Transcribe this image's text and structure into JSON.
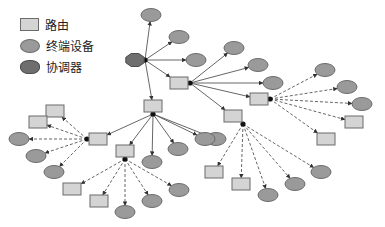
{
  "legend": {
    "items": [
      {
        "symbol": "router",
        "label": "路由"
      },
      {
        "symbol": "end-device",
        "label": "终端设备"
      },
      {
        "symbol": "coordinator",
        "label": "协调器"
      }
    ]
  },
  "colors": {
    "router_fill": "#d4d4d4",
    "end_device_fill": "#9a9a9a",
    "coordinator_fill": "#6e6e6e",
    "stroke": "#6b6b6b",
    "edge": "#555555"
  },
  "nodes": [
    {
      "id": "C",
      "type": "coordinator",
      "x": 135,
      "y": 60
    },
    {
      "id": "E1",
      "type": "end-device",
      "x": 151,
      "y": 15
    },
    {
      "id": "E2",
      "type": "end-device",
      "x": 179,
      "y": 37
    },
    {
      "id": "E3",
      "type": "end-device",
      "x": 196,
      "y": 60
    },
    {
      "id": "R1",
      "type": "router",
      "x": 179,
      "y": 83
    },
    {
      "id": "R2",
      "type": "router",
      "x": 153,
      "y": 106
    },
    {
      "id": "E4",
      "type": "end-device",
      "x": 234,
      "y": 48
    },
    {
      "id": "E5",
      "type": "end-device",
      "x": 258,
      "y": 65
    },
    {
      "id": "E6",
      "type": "end-device",
      "x": 273,
      "y": 83
    },
    {
      "id": "R3",
      "type": "router",
      "x": 259,
      "y": 99
    },
    {
      "id": "R4",
      "type": "router",
      "x": 233,
      "y": 116
    },
    {
      "id": "E7",
      "type": "end-device",
      "x": 325,
      "y": 70
    },
    {
      "id": "E8",
      "type": "end-device",
      "x": 347,
      "y": 87
    },
    {
      "id": "E9",
      "type": "end-device",
      "x": 362,
      "y": 104
    },
    {
      "id": "R5",
      "type": "router",
      "x": 354,
      "y": 122
    },
    {
      "id": "R6",
      "type": "router",
      "x": 326,
      "y": 139
    },
    {
      "id": "E10",
      "type": "end-device",
      "x": 216,
      "y": 139
    },
    {
      "id": "R7",
      "type": "router",
      "x": 214,
      "y": 172
    },
    {
      "id": "R8",
      "type": "router",
      "x": 241,
      "y": 184
    },
    {
      "id": "E11",
      "type": "end-device",
      "x": 268,
      "y": 195
    },
    {
      "id": "E12",
      "type": "end-device",
      "x": 295,
      "y": 184
    },
    {
      "id": "E13",
      "type": "end-device",
      "x": 321,
      "y": 172
    },
    {
      "id": "R9",
      "type": "router",
      "x": 98,
      "y": 139
    },
    {
      "id": "R10",
      "type": "router",
      "x": 125,
      "y": 151
    },
    {
      "id": "E14",
      "type": "end-device",
      "x": 152,
      "y": 162
    },
    {
      "id": "E15",
      "type": "end-device",
      "x": 178,
      "y": 149
    },
    {
      "id": "E16",
      "type": "end-device",
      "x": 205,
      "y": 139
    },
    {
      "id": "R11",
      "type": "router",
      "x": 55,
      "y": 111
    },
    {
      "id": "R12",
      "type": "router",
      "x": 38,
      "y": 122
    },
    {
      "id": "E17",
      "type": "end-device",
      "x": 19,
      "y": 139
    },
    {
      "id": "E18",
      "type": "end-device",
      "x": 36,
      "y": 156
    },
    {
      "id": "E19",
      "type": "end-device",
      "x": 54,
      "y": 172
    },
    {
      "id": "R13",
      "type": "router",
      "x": 72,
      "y": 189
    },
    {
      "id": "R14",
      "type": "router",
      "x": 99,
      "y": 201
    },
    {
      "id": "E20",
      "type": "end-device",
      "x": 125,
      "y": 212
    },
    {
      "id": "E21",
      "type": "end-device",
      "x": 152,
      "y": 201
    },
    {
      "id": "E22",
      "type": "end-device",
      "x": 179,
      "y": 190
    }
  ],
  "edges": [
    {
      "from": "C",
      "to": "E1",
      "style": "solid",
      "hub": [
        145,
        60
      ]
    },
    {
      "from": "C",
      "to": "E2",
      "style": "solid",
      "hub": [
        145,
        60
      ]
    },
    {
      "from": "C",
      "to": "E3",
      "style": "solid",
      "hub": [
        145,
        60
      ]
    },
    {
      "from": "C",
      "to": "R1",
      "style": "solid",
      "hub": [
        145,
        60
      ]
    },
    {
      "from": "C",
      "to": "R2",
      "style": "solid",
      "hub": [
        145,
        60
      ]
    },
    {
      "from": "R1",
      "to": "E4",
      "style": "solid",
      "hub": [
        190,
        83
      ]
    },
    {
      "from": "R1",
      "to": "E5",
      "style": "solid",
      "hub": [
        190,
        83
      ]
    },
    {
      "from": "R1",
      "to": "E6",
      "style": "solid",
      "hub": [
        190,
        83
      ]
    },
    {
      "from": "R1",
      "to": "R3",
      "style": "solid",
      "hub": [
        190,
        83
      ]
    },
    {
      "from": "R1",
      "to": "R4",
      "style": "solid",
      "hub": [
        190,
        83
      ]
    },
    {
      "from": "R3",
      "to": "E7",
      "style": "dashed",
      "hub": [
        270,
        99
      ]
    },
    {
      "from": "R3",
      "to": "E8",
      "style": "dashed",
      "hub": [
        270,
        99
      ]
    },
    {
      "from": "R3",
      "to": "E9",
      "style": "dashed",
      "hub": [
        270,
        99
      ]
    },
    {
      "from": "R3",
      "to": "R5",
      "style": "dashed",
      "hub": [
        270,
        99
      ]
    },
    {
      "from": "R3",
      "to": "R6",
      "style": "dashed",
      "hub": [
        270,
        99
      ]
    },
    {
      "from": "R2",
      "to": "E10",
      "style": "solid",
      "hub": [
        153,
        114
      ]
    },
    {
      "from": "R2",
      "to": "R9",
      "style": "solid",
      "hub": [
        153,
        114
      ]
    },
    {
      "from": "R2",
      "to": "R10",
      "style": "solid",
      "hub": [
        153,
        114
      ]
    },
    {
      "from": "R2",
      "to": "E14",
      "style": "solid",
      "hub": [
        153,
        114
      ]
    },
    {
      "from": "R2",
      "to": "E15",
      "style": "solid",
      "hub": [
        153,
        114
      ]
    },
    {
      "from": "R2",
      "to": "E16",
      "style": "solid",
      "hub": [
        153,
        114
      ]
    },
    {
      "from": "R4",
      "to": "R7",
      "style": "dashed",
      "hub": [
        243,
        124
      ]
    },
    {
      "from": "R4",
      "to": "R8",
      "style": "dashed",
      "hub": [
        243,
        124
      ]
    },
    {
      "from": "R4",
      "to": "E11",
      "style": "dashed",
      "hub": [
        243,
        124
      ]
    },
    {
      "from": "R4",
      "to": "E12",
      "style": "dashed",
      "hub": [
        243,
        124
      ]
    },
    {
      "from": "R4",
      "to": "E13",
      "style": "dashed",
      "hub": [
        243,
        124
      ]
    },
    {
      "from": "R9",
      "to": "R11",
      "style": "dashed",
      "hub": [
        87,
        139
      ]
    },
    {
      "from": "R9",
      "to": "R12",
      "style": "dashed",
      "hub": [
        87,
        139
      ]
    },
    {
      "from": "R9",
      "to": "E17",
      "style": "dashed",
      "hub": [
        87,
        139
      ]
    },
    {
      "from": "R9",
      "to": "E18",
      "style": "dashed",
      "hub": [
        87,
        139
      ]
    },
    {
      "from": "R9",
      "to": "E19",
      "style": "dashed",
      "hub": [
        87,
        139
      ]
    },
    {
      "from": "R10",
      "to": "R13",
      "style": "dashed",
      "hub": [
        125,
        159
      ]
    },
    {
      "from": "R10",
      "to": "R14",
      "style": "dashed",
      "hub": [
        125,
        159
      ]
    },
    {
      "from": "R10",
      "to": "E20",
      "style": "dashed",
      "hub": [
        125,
        159
      ]
    },
    {
      "from": "R10",
      "to": "E21",
      "style": "dashed",
      "hub": [
        125,
        159
      ]
    },
    {
      "from": "R10",
      "to": "E22",
      "style": "dashed",
      "hub": [
        125,
        159
      ]
    }
  ]
}
